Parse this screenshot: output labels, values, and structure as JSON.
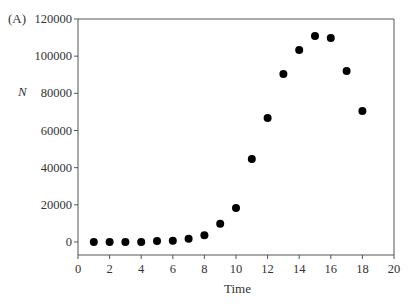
{
  "figure": {
    "panel_label": "(A)",
    "ylabel": "N",
    "xlabel": "Time"
  },
  "chart_data": {
    "type": "scatter",
    "title": "",
    "panel_label": "(A)",
    "xlabel": "Time",
    "ylabel": "N",
    "xlim": [
      0,
      20
    ],
    "ylim": [
      0,
      120000
    ],
    "xticks": [
      0,
      2,
      4,
      6,
      8,
      10,
      12,
      14,
      16,
      18,
      20
    ],
    "yticks": [
      0,
      20000,
      40000,
      60000,
      80000,
      100000,
      120000
    ],
    "grid": false,
    "legend": null,
    "marker": "filled-circle",
    "color": "#000000",
    "series": [
      {
        "name": "N",
        "x": [
          1,
          2,
          3,
          4,
          5,
          6,
          7,
          8,
          9,
          10,
          11,
          12,
          13,
          14,
          15,
          16,
          17,
          18
        ],
        "y": [
          0,
          0,
          0,
          0,
          500,
          700,
          1700,
          3600,
          9800,
          18300,
          44700,
          66700,
          90400,
          103300,
          110900,
          109800,
          92000,
          70500
        ]
      }
    ]
  }
}
